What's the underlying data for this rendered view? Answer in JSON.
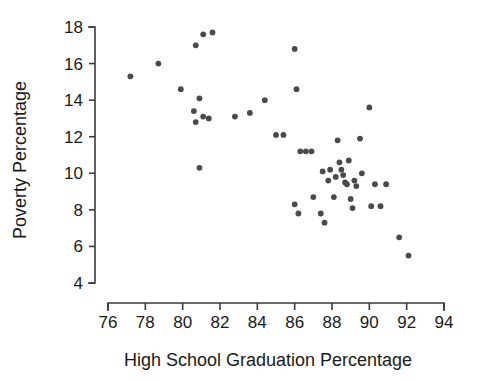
{
  "chart_data": {
    "type": "scatter",
    "title": "",
    "xlabel": "High School Graduation Percentage",
    "ylabel": "Poverty Percentage",
    "xlim": [
      76,
      94
    ],
    "ylim": [
      4,
      18
    ],
    "xticks": [
      76,
      78,
      80,
      82,
      84,
      86,
      88,
      90,
      92,
      94
    ],
    "yticks": [
      4,
      6,
      8,
      10,
      12,
      14,
      16,
      18
    ],
    "xtick_labels": [
      "76",
      "78",
      "80",
      "82",
      "84",
      "86",
      "88",
      "90",
      "92",
      "94"
    ],
    "ytick_labels": [
      "4",
      "6",
      "8",
      "10",
      "12",
      "14",
      "16",
      "18"
    ],
    "grid": false,
    "legend": false,
    "marker_color": "#4a4a4a",
    "marker_size": 5,
    "x": [
      77.2,
      78.7,
      79.9,
      80.7,
      81.1,
      81.6,
      80.9,
      80.6,
      80.7,
      81.1,
      81.4,
      80.9,
      82.8,
      83.6,
      84.4,
      85.0,
      85.4,
      86.0,
      86.1,
      86.3,
      86.0,
      86.6,
      86.9,
      87.0,
      87.4,
      87.5,
      87.8,
      87.9,
      88.1,
      88.3,
      88.4,
      88.5,
      88.6,
      88.7,
      88.8,
      88.9,
      89.0,
      89.1,
      89.3,
      89.5,
      89.6,
      90.0,
      90.1,
      90.3,
      90.6,
      90.9,
      91.6,
      92.1,
      86.2,
      87.6,
      88.2,
      89.2
    ],
    "y": [
      15.3,
      16.0,
      14.6,
      17.0,
      17.6,
      17.7,
      14.1,
      13.4,
      12.8,
      13.1,
      13.0,
      10.3,
      13.1,
      13.3,
      14.0,
      12.1,
      12.1,
      16.8,
      14.6,
      11.2,
      8.3,
      11.2,
      11.2,
      8.7,
      7.8,
      10.1,
      9.6,
      10.2,
      8.7,
      11.8,
      10.6,
      10.2,
      9.9,
      9.5,
      9.4,
      10.7,
      8.6,
      8.1,
      9.3,
      11.9,
      10.0,
      13.6,
      8.2,
      9.4,
      8.2,
      9.4,
      6.5,
      5.5,
      7.8,
      7.3,
      9.8,
      9.6
    ]
  },
  "axes": {
    "x_axis_name": "x-axis",
    "y_axis_name": "y-axis"
  }
}
